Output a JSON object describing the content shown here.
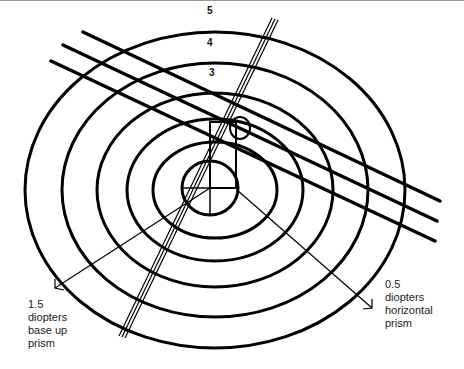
{
  "diagram": {
    "ring_labels": [
      "5",
      "4",
      "3",
      "2"
    ],
    "annotations": {
      "vertical": {
        "line1": "1.5",
        "line2": "diopters",
        "line3": "base up",
        "line4": "prism"
      },
      "horizontal": {
        "line1": "0.5",
        "line2": "diopters",
        "line3": "horizontal",
        "line4": "prism"
      }
    },
    "colors": {
      "stroke": "#000000",
      "border": "#9a9a9a",
      "text": "#222222"
    }
  }
}
